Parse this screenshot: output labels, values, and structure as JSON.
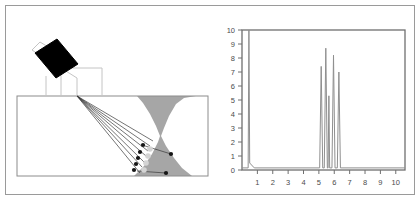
{
  "figure": {
    "title": "",
    "border_color": "#9a9a9a",
    "background": "#ffffff"
  },
  "left_panel": {
    "name": "weld-inspection-schematic",
    "colors": {
      "weld_fill": "#a6a6a6",
      "specimen_outline": "#8c8c8c",
      "probe_body": "#000000",
      "wedge_outline": "#b5b5b5",
      "beam_ray": "#3a3a3a",
      "defect_dark": "#1a1a1a",
      "defect_light": "#d4d4d4"
    },
    "parts": [
      {
        "name": "specimen-block",
        "label": ""
      },
      {
        "name": "weld-bead",
        "label": ""
      },
      {
        "name": "angle-beam-probe",
        "label": ""
      },
      {
        "name": "probe-wedge",
        "label": ""
      },
      {
        "name": "beam-rays",
        "label": "",
        "count": 7
      },
      {
        "name": "defect-indications",
        "label": "",
        "count": 9
      }
    ],
    "beam_rays": [
      {
        "x1": 71,
        "y1": 90,
        "x2": 146,
        "y2": 136
      },
      {
        "x1": 71,
        "y1": 90,
        "x2": 143,
        "y2": 141
      },
      {
        "x1": 71,
        "y1": 90,
        "x2": 141,
        "y2": 146
      },
      {
        "x1": 71,
        "y1": 90,
        "x2": 139,
        "y2": 151
      },
      {
        "x1": 71,
        "y1": 90,
        "x2": 137,
        "y2": 156
      },
      {
        "x1": 71,
        "y1": 90,
        "x2": 135,
        "y2": 161
      },
      {
        "x1": 71,
        "y1": 90,
        "x2": 133,
        "y2": 166
      }
    ],
    "reflected_rays": [
      {
        "x1": 135,
        "y1": 138,
        "x2": 164,
        "y2": 148
      },
      {
        "x1": 131,
        "y1": 164,
        "x2": 159,
        "y2": 166
      }
    ],
    "defects": [
      {
        "x": 136,
        "y": 139,
        "r": 2.0,
        "tone": "dark"
      },
      {
        "x": 133,
        "y": 145,
        "r": 2.0,
        "tone": "dark"
      },
      {
        "x": 131,
        "y": 151,
        "r": 2.0,
        "tone": "dark"
      },
      {
        "x": 129,
        "y": 157,
        "r": 2.0,
        "tone": "dark"
      },
      {
        "x": 127,
        "y": 163,
        "r": 2.0,
        "tone": "dark"
      },
      {
        "x": 143,
        "y": 143,
        "r": 2.6,
        "tone": "light"
      },
      {
        "x": 141,
        "y": 150,
        "r": 2.6,
        "tone": "light"
      },
      {
        "x": 139,
        "y": 157,
        "r": 2.6,
        "tone": "light"
      },
      {
        "x": 137,
        "y": 164,
        "r": 2.6,
        "tone": "light"
      },
      {
        "x": 164,
        "y": 148,
        "r": 2.0,
        "tone": "dark"
      },
      {
        "x": 159,
        "y": 166,
        "r": 2.0,
        "tone": "dark"
      }
    ]
  },
  "chart_data": {
    "type": "line",
    "name": "a-scan-amplitude-trace",
    "title": "",
    "xlabel": "",
    "ylabel": "",
    "xlim": [
      0,
      10.6
    ],
    "ylim": [
      0,
      10
    ],
    "grid": false,
    "legend": null,
    "x_ticks": [
      1,
      2,
      3,
      4,
      5,
      6,
      7,
      8,
      9,
      10
    ],
    "x_tick_labels": [
      "1",
      "2",
      "3",
      "4",
      "5",
      "6",
      "7",
      "8",
      "9",
      "10"
    ],
    "y_ticks": [
      0,
      1,
      2,
      3,
      4,
      5,
      6,
      7,
      8,
      9,
      10
    ],
    "y_tick_labels": [
      "0",
      "1",
      "2",
      "3",
      "4",
      "5",
      "6",
      "7",
      "8",
      "9",
      "10"
    ],
    "line_color": "#8f8f8f",
    "axis_color": "#6f6f6f",
    "baseline": 0.15,
    "peaks": [
      {
        "x": 0.45,
        "y": 10.0,
        "label": "initial-pulse"
      },
      {
        "x": 5.15,
        "y": 7.4,
        "label": "indication-1"
      },
      {
        "x": 5.45,
        "y": 8.7,
        "label": "indication-2"
      },
      {
        "x": 5.65,
        "y": 5.3,
        "label": "indication-3"
      },
      {
        "x": 5.95,
        "y": 8.2,
        "label": "indication-4"
      },
      {
        "x": 6.3,
        "y": 7.0,
        "label": "indication-5"
      }
    ],
    "x": [
      0.0,
      0.4,
      0.45,
      0.5,
      0.8,
      5.05,
      5.15,
      5.25,
      5.35,
      5.45,
      5.55,
      5.6,
      5.65,
      5.7,
      5.85,
      5.95,
      6.05,
      6.2,
      6.3,
      6.4,
      10.6
    ],
    "values": [
      0.15,
      0.15,
      10.0,
      0.5,
      0.15,
      0.15,
      7.4,
      0.15,
      0.15,
      8.7,
      0.15,
      0.15,
      5.3,
      0.15,
      0.15,
      8.2,
      0.15,
      0.15,
      7.0,
      0.15,
      0.15
    ]
  }
}
